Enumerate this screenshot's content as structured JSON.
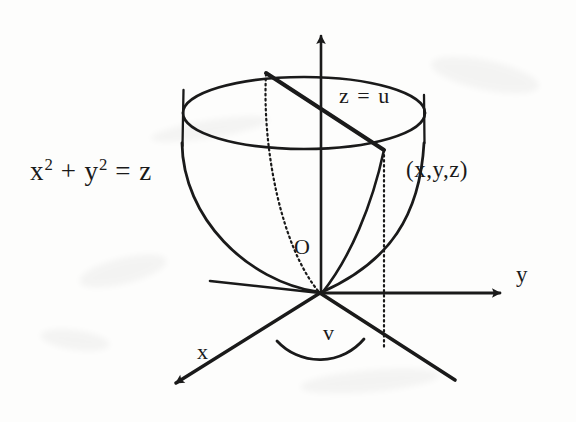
{
  "figure": {
    "background_color": "#fdfdfc",
    "ink_color": "#1a1a1a",
    "labels": {
      "surface_equation_base": "x",
      "surface_equation_exp1": "2",
      "surface_equation_plus": "+ y",
      "surface_equation_exp2": "2",
      "surface_equation_tail": "= z",
      "plane": "z = u",
      "point": "(x,y,z)",
      "origin": "O",
      "axis_x": "x",
      "axis_y": "y",
      "axis_z": "",
      "angle": "v"
    }
  },
  "geometry": {
    "origin": {
      "x": 320,
      "y": 293
    },
    "axes": {
      "z": {
        "from": [
          321,
          293
        ],
        "to": [
          321,
          27
        ],
        "arrow": true
      },
      "y": {
        "from": [
          320,
          293
        ],
        "to": [
          510,
          293
        ],
        "arrow": true
      },
      "x": {
        "from": [
          320,
          293
        ],
        "to": [
          165,
          390
        ],
        "arrow": true
      },
      "negative_y_ray": {
        "from": [
          320,
          293
        ],
        "to": [
          455,
          380
        ]
      },
      "negative_x_ray": {
        "from": [
          320,
          293
        ],
        "to": [
          210,
          280
        ]
      }
    },
    "rim_ellipse": {
      "cx": 304,
      "cy": 113,
      "rx": 121,
      "ry": 36
    },
    "rim_ticks": [
      {
        "x": 183,
        "y1": 90,
        "y2": 146
      },
      {
        "x": 424,
        "y1": 95,
        "y2": 143
      }
    ],
    "point_marker": {
      "x": 384,
      "y": 150
    },
    "chord": {
      "from": [
        266,
        73
      ],
      "to": [
        384,
        150
      ]
    },
    "dropline": {
      "x": 384,
      "y1": 150,
      "y2": 347
    },
    "dotted_back_edge": {
      "from": [
        266,
        73
      ],
      "to": [
        320,
        293
      ]
    },
    "angle_arc": {
      "cx": 320,
      "cy": 293,
      "r": 58,
      "from_deg": 148,
      "to_deg": 32
    }
  }
}
